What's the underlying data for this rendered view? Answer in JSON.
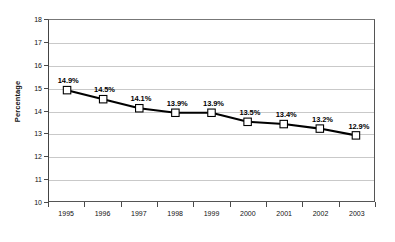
{
  "chart_data": {
    "type": "line",
    "title": "",
    "subtitle": "",
    "xlabel": "",
    "ylabel": "Percentage",
    "categories": [
      "1995",
      "1996",
      "1997",
      "1998",
      "1999",
      "2000",
      "2001",
      "2002",
      "2003"
    ],
    "values": [
      14.9,
      14.5,
      14.1,
      13.9,
      13.9,
      13.5,
      13.4,
      13.2,
      12.9
    ],
    "data_labels": [
      "14.9%",
      "14.5%",
      "14.1%",
      "13.9%",
      "13.9%",
      "13.5%",
      "13.4%",
      "13.2%",
      "12.9%"
    ],
    "ylim": [
      10,
      18
    ],
    "y_ticks": [
      10,
      11,
      12,
      13,
      14,
      15,
      16,
      17,
      18
    ],
    "y_tick_labels": [
      "10",
      "11",
      "12",
      "13",
      "14",
      "15",
      "16",
      "17",
      "18"
    ],
    "grid": true,
    "grid_axis": "y",
    "legend": false,
    "legend_position": "none",
    "marker": "square",
    "series": [
      {
        "name": "Percentage",
        "values": [
          14.9,
          14.5,
          14.1,
          13.9,
          13.9,
          13.5,
          13.4,
          13.2,
          12.9
        ]
      }
    ],
    "colors": {
      "line": "#000000",
      "marker_fill": "#ffffff",
      "marker_edge": "#000000",
      "gridline": "#c9c9c9",
      "axis": "#555555",
      "text": "#111111",
      "background": "#ffffff"
    }
  }
}
